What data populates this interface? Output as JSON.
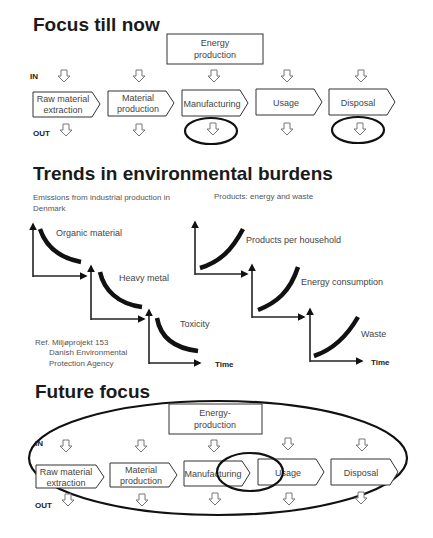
{
  "sections": {
    "focus_now": {
      "title": "Focus till now",
      "energy_box": [
        "Energy",
        "production"
      ],
      "in_label": "IN",
      "out_label": "OUT",
      "stages": [
        {
          "lines": [
            "Raw material",
            "extraction"
          ]
        },
        {
          "lines": [
            "Material",
            "production"
          ]
        },
        {
          "lines": [
            "Manufacturing"
          ]
        },
        {
          "lines": [
            "Usage"
          ]
        },
        {
          "lines": [
            "Disposal"
          ]
        }
      ],
      "highlighted_outputs": [
        "Manufacturing",
        "Disposal"
      ]
    },
    "trends": {
      "title": "Trends in environmental burdens",
      "left_caption": [
        "Emissions from industrial production in",
        "Denmark"
      ],
      "right_caption": "Products: energy and waste",
      "left_charts": [
        {
          "label": "Organic material",
          "trend": "decreasing"
        },
        {
          "label": "Heavy metal",
          "trend": "decreasing"
        },
        {
          "label": "Toxicity",
          "trend": "decreasing"
        }
      ],
      "right_charts": [
        {
          "label": "Products per household",
          "trend": "increasing"
        },
        {
          "label": "Energy consumption",
          "trend": "increasing"
        },
        {
          "label": "Waste",
          "trend": "increasing"
        }
      ],
      "x_axis_label": "Time",
      "reference": [
        "Ref. Miljøprojekt 153",
        "Danish Environmental",
        "Protection Agency"
      ]
    },
    "future_focus": {
      "title": "Future focus",
      "energy_box": [
        "Energy-",
        "production"
      ],
      "in_label": "IN",
      "out_label": "OUT",
      "stages": [
        {
          "lines": [
            "Raw material",
            "extraction"
          ]
        },
        {
          "lines": [
            "Material",
            "production"
          ]
        },
        {
          "lines": [
            "Manufacturing"
          ]
        },
        {
          "lines": [
            "Usage"
          ]
        },
        {
          "lines": [
            "Disposal"
          ]
        }
      ],
      "highlighted_overlap": [
        "Manufacturing",
        "Usage"
      ]
    }
  }
}
